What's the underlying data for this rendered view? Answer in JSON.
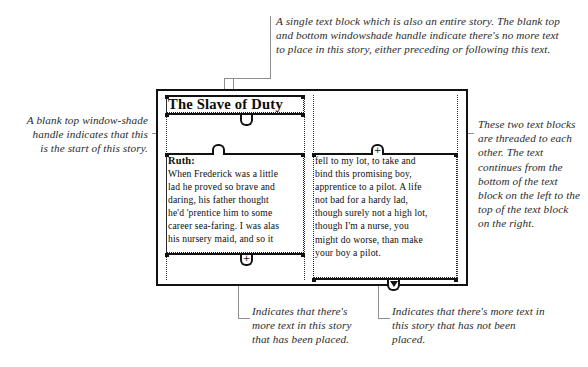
{
  "figure": {
    "type": "annotated-diagram"
  },
  "page": {
    "title_block": {
      "title": "The Slave of Duty"
    },
    "left_block": {
      "heading": "Ruth:",
      "lines": [
        "When Frederick was a little",
        "lad he proved so brave and",
        "daring, his father thought",
        "he'd 'prentice him to some",
        "career sea-faring. I was alas",
        "his nursery maid, and so it"
      ]
    },
    "right_block": {
      "lines": [
        "fell to my lot, to take and",
        "bind this promising boy,",
        "apprentice to a pilot. A life",
        "not bad for a hardy lad,",
        "though surely not a high lot,",
        "though I'm a nurse, you",
        "might do worse, than make",
        "your boy a pilot."
      ]
    },
    "handles": {
      "title_top": {
        "glyph": "",
        "name": "blank-windowshade-handle"
      },
      "title_bottom": {
        "glyph": "",
        "name": "blank-windowshade-handle"
      },
      "left_top": {
        "glyph": "",
        "name": "blank-windowshade-handle"
      },
      "left_bottom": {
        "glyph": "+",
        "name": "plus-windowshade-handle"
      },
      "right_top": {
        "glyph": "+",
        "name": "plus-windowshade-handle"
      },
      "right_bottom": {
        "glyph": "▼",
        "name": "overset-windowshade-handle"
      }
    }
  },
  "annotations": {
    "top": "A single text block which is also an entire story. The blank top and bottom windowshade handle indicate there's no more text to place in this story, either preceding or following this text.",
    "left": "A blank top window-shade handle indicates that this is the start of this story.",
    "right": "These two text blocks are threaded to each other. The text continues from the bottom of the text block on the left to the top of the text block on the right.",
    "bottom_left": "Indicates that there's more text in this story that has been placed.",
    "bottom_right": "Indicates that there's more text in this story that has not been placed."
  },
  "colors": {
    "ink": "#111111",
    "leader": "#8e8e8e",
    "paper": "#ffffff",
    "guide": "#333333"
  }
}
